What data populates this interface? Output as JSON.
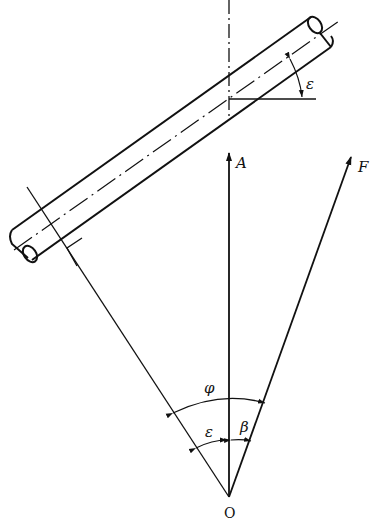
{
  "diagram": {
    "type": "force-vector geometry",
    "labels": {
      "epsilon_top": "ε",
      "axial_force": "A",
      "resultant_force": "F",
      "angle_phi": "φ",
      "angle_epsilon": "ε",
      "angle_beta": "β",
      "origin": "O"
    },
    "elements": [
      "inclined cylindrical shaft with centerline",
      "vertical dash-dot reference axis",
      "horizontal reference line",
      "angle arc epsilon between shaft and horizontal",
      "vector A (vertical)",
      "vector F (inclined)",
      "line perpendicular to shaft through O",
      "right-angle marker",
      "angle arc phi",
      "angle arcs epsilon and beta"
    ],
    "colors": {
      "stroke": "#111111",
      "background": "#ffffff"
    }
  }
}
